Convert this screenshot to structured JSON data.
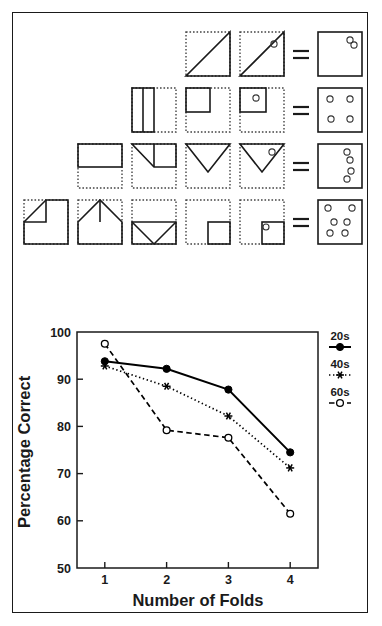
{
  "figure": {
    "panel_a": {
      "name": "paper-folding-diagram",
      "description": "Four rows of paper-folding-and-punch problems; each row shows successive folds of a square sheet, a hole punch, then the unfolded result with punched holes.",
      "equals_symbol": "=",
      "rows": [
        {
          "folds": 1,
          "steps": [
            "square-folded-diagonal",
            "square-folded-diagonal-punched"
          ],
          "result_holes": 2,
          "result_hole_positions": [
            [
              0.74,
              0.18
            ],
            [
              0.82,
              0.27
            ]
          ]
        },
        {
          "folds": 2,
          "steps": [
            "square-folded-vertical-half",
            "square-folded-horizontal-quarter",
            "square-quarter-punched"
          ],
          "result_holes": 4,
          "result_hole_positions": [
            [
              0.27,
              0.24
            ],
            [
              0.73,
              0.24
            ],
            [
              0.3,
              0.7
            ],
            [
              0.72,
              0.7
            ]
          ]
        },
        {
          "folds": 3,
          "steps": [
            "square-folded-top-half",
            "square-corner-folded",
            "square-triangle-fold",
            "square-triangle-punched"
          ],
          "result_holes": 4,
          "result_hole_positions": [
            [
              0.66,
              0.18
            ],
            [
              0.72,
              0.35
            ],
            [
              0.74,
              0.6
            ],
            [
              0.66,
              0.76
            ]
          ]
        },
        {
          "folds": 4,
          "steps": [
            "square-corner-fold",
            "square-two-corner-fold",
            "square-envelope-fold",
            "square-small-quarter",
            "square-small-quarter-punched"
          ],
          "result_holes": 6,
          "result_hole_positions": [
            [
              0.24,
              0.17
            ],
            [
              0.76,
              0.17
            ],
            [
              0.36,
              0.5
            ],
            [
              0.66,
              0.5
            ],
            [
              0.26,
              0.76
            ],
            [
              0.62,
              0.76
            ]
          ]
        }
      ]
    }
  },
  "chart_data": {
    "type": "line",
    "title": "",
    "xlabel": "Number of Folds",
    "ylabel": "Percentage Correct",
    "x": [
      1,
      2,
      3,
      4
    ],
    "xtick_labels": [
      "1",
      "2",
      "3",
      "4"
    ],
    "ytick_labels": [
      "50",
      "60",
      "70",
      "80",
      "90",
      "100"
    ],
    "yticks": [
      50,
      60,
      70,
      80,
      90,
      100
    ],
    "xlim": [
      0.55,
      4.45
    ],
    "ylim": [
      50,
      100
    ],
    "grid": false,
    "legend_position": "right",
    "series": [
      {
        "name": "20s",
        "values": [
          93.8,
          92.2,
          87.8,
          74.5
        ],
        "line_style": "solid",
        "marker": "filled-circle",
        "color": "#000000"
      },
      {
        "name": "40s",
        "values": [
          92.8,
          88.5,
          82.2,
          71.2
        ],
        "line_style": "dotted",
        "marker": "star",
        "color": "#000000"
      },
      {
        "name": "60s",
        "values": [
          97.5,
          79.2,
          77.6,
          61.5
        ],
        "line_style": "dashed",
        "marker": "open-circle",
        "color": "#000000"
      }
    ],
    "legend": [
      {
        "label": "20s",
        "marker": "filled-circle",
        "line_style": "solid"
      },
      {
        "label": "40s",
        "marker": "star",
        "line_style": "dotted"
      },
      {
        "label": "60s",
        "marker": "open-circle",
        "line_style": "dashed"
      }
    ]
  },
  "colors": {
    "ink": "#1a1a1a",
    "background": "#ffffff",
    "dotted_fold": "#555555"
  }
}
